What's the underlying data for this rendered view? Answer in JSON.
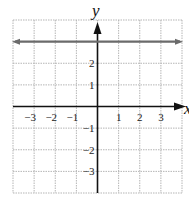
{
  "chart_data": {
    "type": "line",
    "title": "",
    "xlabel": "x",
    "ylabel": "y",
    "xlim": [
      -4,
      4
    ],
    "ylim": [
      -4,
      4
    ],
    "grid": true,
    "x_ticks": [
      "−3",
      "−2",
      "−1",
      "1",
      "2",
      "3"
    ],
    "x_tick_values": [
      -3,
      -2,
      -1,
      1,
      2,
      3
    ],
    "y_ticks": [
      "2",
      "1",
      "−1",
      "−2",
      "−3"
    ],
    "y_tick_values": [
      2,
      1,
      -1,
      -2,
      -3
    ],
    "series": [
      {
        "name": "y = 3",
        "x": [
          -4,
          4
        ],
        "y": [
          3,
          3
        ],
        "color": "#6b6b6b",
        "arrows": "both"
      }
    ]
  },
  "labels": {
    "x_axis": "x",
    "y_axis": "y"
  },
  "colors": {
    "grid": "#b5b5b5",
    "axes": "#111111",
    "line": "#6b6b6b"
  }
}
